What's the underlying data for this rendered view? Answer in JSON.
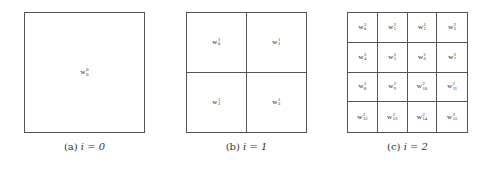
{
  "panels": [
    {
      "id": "a",
      "caption_prefix": "(a)",
      "caption_math": "i = 0",
      "grid_size": 1,
      "cells": [
        {
          "base": "w",
          "sup": "0",
          "sub": "0"
        }
      ]
    },
    {
      "id": "b",
      "caption_prefix": "(b)",
      "caption_math": "i = 1",
      "grid_size": 2,
      "cells": [
        {
          "base": "w",
          "sup": "1",
          "sub": "0"
        },
        {
          "base": "w",
          "sup": "1",
          "sub": "1"
        },
        {
          "base": "w",
          "sup": "1",
          "sub": "2"
        },
        {
          "base": "w",
          "sup": "1",
          "sub": "3"
        }
      ]
    },
    {
      "id": "c",
      "caption_prefix": "(c)",
      "caption_math": "i = 2",
      "grid_size": 4,
      "cells": [
        {
          "base": "w",
          "sup": "2",
          "sub": "0"
        },
        {
          "base": "w",
          "sup": "2",
          "sub": "1"
        },
        {
          "base": "w",
          "sup": "2",
          "sub": "2"
        },
        {
          "base": "w",
          "sup": "2",
          "sub": "3"
        },
        {
          "base": "w",
          "sup": "2",
          "sub": "4"
        },
        {
          "base": "w",
          "sup": "2",
          "sub": "5"
        },
        {
          "base": "w",
          "sup": "2",
          "sub": "6"
        },
        {
          "base": "w",
          "sup": "2",
          "sub": "7"
        },
        {
          "base": "w",
          "sup": "2",
          "sub": "8"
        },
        {
          "base": "w",
          "sup": "2",
          "sub": "9"
        },
        {
          "base": "w",
          "sup": "2",
          "sub": "10"
        },
        {
          "base": "w",
          "sup": "2",
          "sub": "11"
        },
        {
          "base": "w",
          "sup": "2",
          "sub": "12"
        },
        {
          "base": "w",
          "sup": "2",
          "sub": "13"
        },
        {
          "base": "w",
          "sup": "2",
          "sub": "14"
        },
        {
          "base": "w",
          "sup": "2",
          "sub": "15"
        }
      ]
    }
  ]
}
